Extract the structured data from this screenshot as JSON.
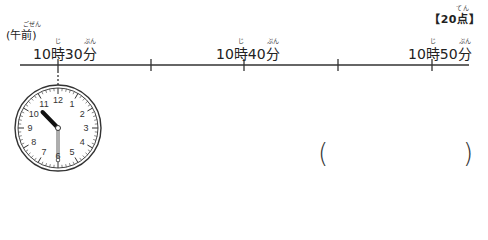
{
  "score": {
    "open": "【",
    "value": "20",
    "unit": "点",
    "unit_reading": "てん",
    "close": "】"
  },
  "am_label": {
    "open": "(",
    "text_1": "午",
    "text_2": "前",
    "reading": "ごぜん",
    "close": ")"
  },
  "timeline": {
    "labels": [
      {
        "hour": "10",
        "hour_unit": "時",
        "hour_unit_reading": "じ",
        "minute": "30",
        "minute_unit": "分",
        "minute_unit_reading": "ぷん"
      },
      {
        "hour": "10",
        "hour_unit": "時",
        "hour_unit_reading": "じ",
        "minute": "40",
        "minute_unit": "分",
        "minute_unit_reading": "ぷん"
      },
      {
        "hour": "10",
        "hour_unit": "時",
        "hour_unit_reading": "じ",
        "minute": "50",
        "minute_unit": "分",
        "minute_unit_reading": "ぷん"
      }
    ],
    "tick_count": 5
  },
  "clock": {
    "numbers": [
      "12",
      "1",
      "2",
      "3",
      "4",
      "5",
      "6",
      "7",
      "8",
      "9",
      "10",
      "11"
    ],
    "hour": 10,
    "minute": 30
  },
  "answer": {
    "open": "(",
    "value": "",
    "close": ")"
  }
}
